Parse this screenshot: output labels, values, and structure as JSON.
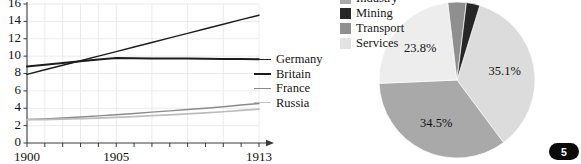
{
  "chart_data": [
    {
      "type": "line",
      "title": "",
      "xlabel": "",
      "ylabel": "",
      "x": [
        1900,
        1901,
        1902,
        1903,
        1904,
        1905,
        1906,
        1907,
        1908,
        1909,
        1910,
        1911,
        1912,
        1913
      ],
      "xlim": [
        1900,
        1913
      ],
      "ylim": [
        0,
        16
      ],
      "yticks": [
        "0",
        "2",
        "4",
        "6",
        "8",
        "10",
        "12",
        "14",
        "16"
      ],
      "xticks_labeled": [
        "1900",
        "1905",
        "1913"
      ],
      "grid": true,
      "legend_position": "right",
      "series": [
        {
          "name": "Germany",
          "color": "#1c1c1c",
          "values": [
            7.9,
            8.43,
            8.95,
            9.47,
            10.0,
            10.52,
            11.05,
            11.57,
            12.1,
            12.62,
            13.15,
            13.67,
            14.2,
            14.7
          ]
        },
        {
          "name": "Britain",
          "color": "#1c1c1c",
          "values": [
            8.8,
            9.0,
            9.2,
            9.4,
            9.6,
            9.78,
            9.76,
            9.74,
            9.73,
            9.72,
            9.7,
            9.68,
            9.67,
            9.65
          ]
        },
        {
          "name": "France",
          "color": "#8a8a8a",
          "values": [
            2.7,
            2.78,
            2.88,
            3.0,
            3.12,
            3.25,
            3.4,
            3.55,
            3.7,
            3.85,
            4.0,
            4.18,
            4.37,
            4.55
          ]
        },
        {
          "name": "Russia",
          "color": "#bdbdbd",
          "values": [
            2.68,
            2.7,
            2.74,
            2.8,
            2.87,
            2.95,
            3.04,
            3.14,
            3.24,
            3.35,
            3.47,
            3.6,
            3.75,
            3.9
          ]
        }
      ]
    },
    {
      "type": "pie",
      "title": "",
      "labels": [
        "Industry",
        "Mining",
        "Transport",
        "Services",
        "Agriculture"
      ],
      "legend_visible": [
        "Industry",
        "Mining",
        "Transport",
        "Services"
      ],
      "legend_position": "left",
      "slices": [
        {
          "label": "Services",
          "value": 35.1,
          "display": "35.1%",
          "color": "#dcdcdc"
        },
        {
          "label": "Industry",
          "value": 34.5,
          "display": "34.5%",
          "color": "#a9a9a9"
        },
        {
          "label": "Agriculture",
          "value": 23.8,
          "display": "23.8%",
          "color": "#ededed"
        },
        {
          "label": "Transport",
          "value": 3.8,
          "display": "3.8%",
          "color": "#8f8f8f"
        },
        {
          "label": "Mining",
          "value": 2.8,
          "display": "2.8%",
          "color": "#262626"
        }
      ]
    }
  ],
  "line_chart": {
    "legend": [
      {
        "label": "Germany",
        "color": "#1c1c1c",
        "weight": 1.6
      },
      {
        "label": "Britain",
        "color": "#1c1c1c",
        "weight": 2.1
      },
      {
        "label": "France",
        "color": "#8a8a8a",
        "weight": 1.5
      },
      {
        "label": "Russia",
        "color": "#c2c2c2",
        "weight": 1.8
      }
    ],
    "yticks": [
      "16",
      "14",
      "12",
      "10",
      "8",
      "6",
      "4",
      "2",
      "0"
    ],
    "xticks": [
      "1900",
      "1905",
      "1913"
    ]
  },
  "pie_chart": {
    "legend": [
      {
        "label": "Industry",
        "color": "#a9a9a9"
      },
      {
        "label": "Mining",
        "color": "#262626"
      },
      {
        "label": "Transport",
        "color": "#8f8f8f"
      },
      {
        "label": "Services",
        "color": "#e3e3e3"
      }
    ],
    "labels": [
      "34.5%",
      "23.8%",
      "35.1%",
      "3.8%",
      "2.8%"
    ]
  },
  "page": {
    "number": "5"
  },
  "colors": {
    "axis": "#3a3a3a",
    "grid": "#ebebeb",
    "text": "#151515",
    "badge_bg": "#0a0a0a",
    "badge_fg": "#ffffff"
  }
}
